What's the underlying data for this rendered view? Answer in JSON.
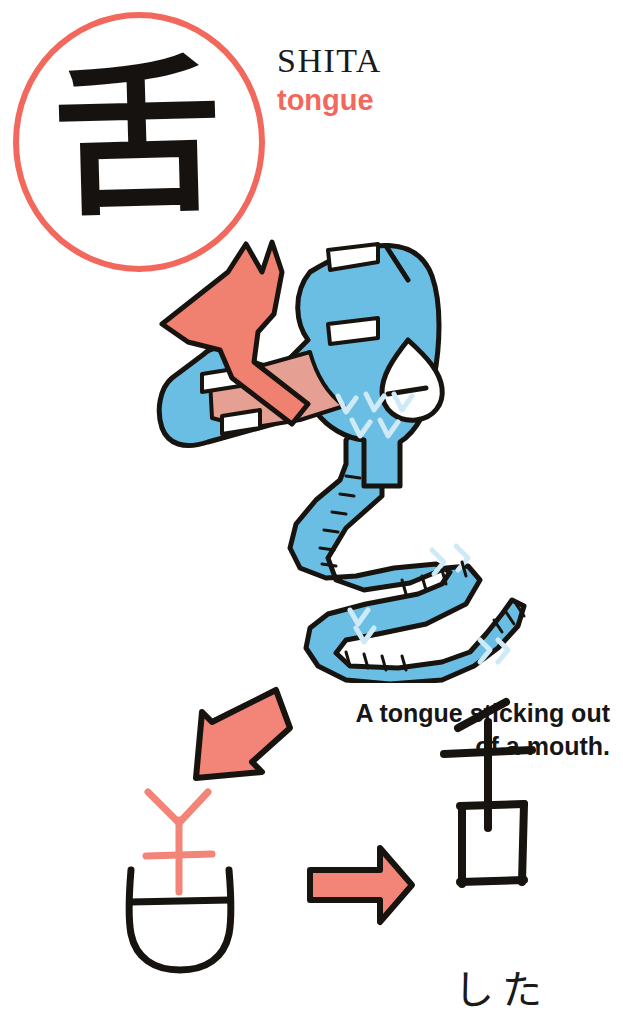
{
  "page": {
    "background_color": "#ffffff",
    "width": 623,
    "height": 1026
  },
  "colors": {
    "coral": "#F2685C",
    "coral_fill": "#F28478",
    "blue": "#6BBEE3",
    "mouth_pink": "#E5A093",
    "ink_black": "#17130f",
    "white": "#ffffff"
  },
  "kanji_badge": {
    "character": "舌",
    "circle_color": "#F2685C"
  },
  "heading": {
    "romaji": "SHITA",
    "meaning": "tongue"
  },
  "caption": {
    "line1": "A tongue sticking out",
    "line2": "of a mouth."
  },
  "illustration": {
    "description": "A cartoon blue mouth with white teeth, pink interior and a coral tongue sticking out, body zigzagging downward",
    "tongue_color": "#F08070",
    "mouth_body_color": "#6BBEE3",
    "mouth_interior_color": "#E5A093",
    "teeth_color": "#ffffff"
  },
  "evolution": {
    "pictograph_label": "ancient pictograph of tongue above mouth",
    "arrow_down_label": "arrow pointing to pictograph",
    "arrow_right_label": "evolves into",
    "modern_kanji": "舌",
    "reading": "した"
  }
}
